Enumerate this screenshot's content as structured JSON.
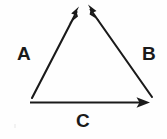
{
  "figure": {
    "kind": "vector-triangle-diagram",
    "background_color": "#fefefe",
    "stroke_color": "#1a1a1a",
    "width": 167,
    "height": 139,
    "labels": {
      "a": "A",
      "b": "B",
      "c": "C"
    },
    "vectors": [
      {
        "id": "vector-a",
        "label": "A",
        "description": "left side of triangle, arrow pointing up and to the right toward the apex",
        "start": [
          32,
          98
        ],
        "end": [
          79,
          7
        ],
        "arrowhead_at": "end",
        "label_position": [
          17,
          44
        ]
      },
      {
        "id": "vector-b",
        "label": "B",
        "description": "right side of triangle, arrow pointing up and to the left toward the apex",
        "start": [
          152,
          97
        ],
        "end": [
          88,
          5
        ],
        "arrowhead_at": "end",
        "label_position": [
          142,
          44
        ]
      },
      {
        "id": "vector-c",
        "label": "C",
        "description": "bottom side of triangle, horizontal arrow pointing to the right",
        "start": [
          30,
          102
        ],
        "end": [
          150,
          102
        ],
        "arrowhead_at": "end",
        "label_position": [
          76,
          111
        ]
      }
    ]
  }
}
